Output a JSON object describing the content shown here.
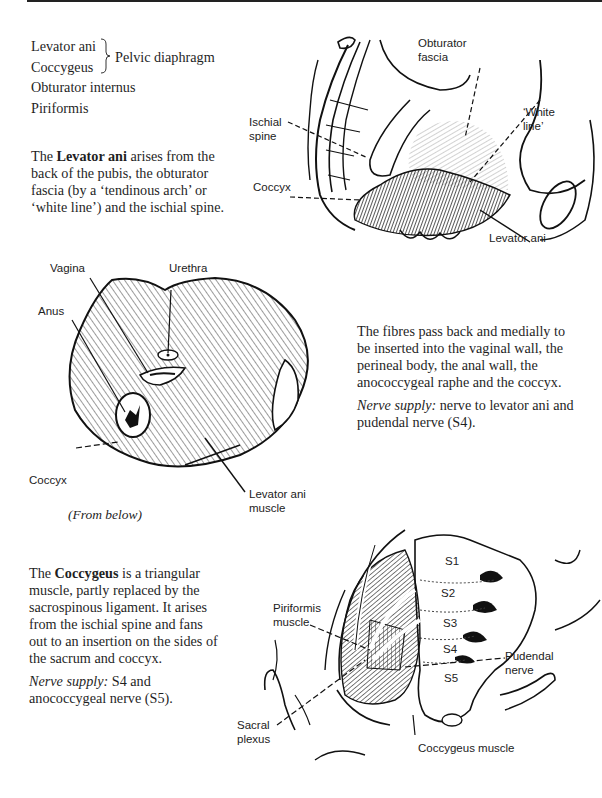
{
  "page": {
    "muscle_list": {
      "items": [
        "Levator ani",
        "Coccygeus",
        "Obturator internus",
        "Piriformis"
      ],
      "brace_group_label": "Pelvic diaphragm"
    },
    "levator_intro": {
      "prefix": "The ",
      "bold": "Levator ani",
      "lines": [
        " arises from the",
        "back of the pubis, the obturator",
        "fascia (by a ‘tendinous arch’ or",
        "‘white line’) and the ischial spine."
      ]
    },
    "figure1": {
      "labels": {
        "obturator_fascia_1": "Obturator",
        "obturator_fascia_2": "fascia",
        "white_line_1": "‘White",
        "white_line_2": "line’",
        "ischial_spine_1": "Ischial",
        "ischial_spine_2": "spine",
        "coccyx": "Coccyx",
        "levator_ani": "Levator ani"
      }
    },
    "figure2": {
      "labels": {
        "vagina": "Vagina",
        "urethra": "Urethra",
        "anus": "Anus",
        "coccyx": "Coccyx",
        "levator_ani_muscle_1": "Levator ani",
        "levator_ani_muscle_2": "muscle"
      },
      "caption": "(From below)"
    },
    "fibres_text": {
      "lines": [
        "The fibres pass back and medially to",
        "be inserted into the vaginal wall, the",
        "perineal body, the anal wall, the",
        "anococcygeal raphe and the coccyx."
      ],
      "nerve_label": "Nerve supply:",
      "nerve_lines": [
        " nerve to levator ani and",
        "pudendal nerve (S4)."
      ]
    },
    "coccygeus_text": {
      "prefix": "The ",
      "bold": "Coccygeus",
      "lines": [
        " is a triangular",
        "muscle, partly replaced by the",
        "sacrospinous ligament. It arises",
        "from the ischial spine and fans",
        "out to an insertion on the sides of",
        "the sacrum and coccyx."
      ],
      "nerve_label": "Nerve supply:",
      "nerve_lines": [
        " S4 and",
        "anococcygeal nerve (S5)."
      ]
    },
    "figure3": {
      "labels": {
        "s1": "S1",
        "s2": "S2",
        "s3": "S3",
        "s4": "S4",
        "s5": "S5",
        "piriformis_1": "Piriformis",
        "piriformis_2": "muscle",
        "pudendal_1": "Pudendal",
        "pudendal_2": "nerve",
        "sacral_plexus_1": "Sacral",
        "sacral_plexus_2": "plexus",
        "coccygeus_muscle": "Coccygeus muscle"
      }
    }
  }
}
